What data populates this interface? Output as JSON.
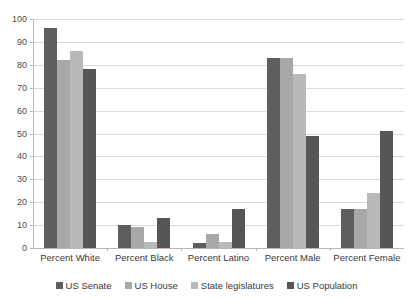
{
  "chart_data": {
    "type": "bar",
    "title": "",
    "subtitle": "",
    "xlabel": "",
    "ylabel": "",
    "ylim": [
      0,
      100
    ],
    "ytick_step": 10,
    "yticks": [
      0,
      10,
      20,
      30,
      40,
      50,
      60,
      70,
      80,
      90,
      100
    ],
    "grid": true,
    "legend_position": "bottom",
    "categories": [
      "Percent White",
      "Percent Black",
      "Percent Latino",
      "Percent Male",
      "Percent Female"
    ],
    "series": [
      {
        "name": "US Senate",
        "color": "#5e5e5e",
        "values": [
          96,
          10,
          2,
          83,
          17
        ]
      },
      {
        "name": "US House",
        "color": "#a8a8a8",
        "values": [
          82,
          9,
          6,
          83,
          17
        ]
      },
      {
        "name": "State legislatures",
        "color": "#b9b9b9",
        "values": [
          86,
          2.5,
          2.5,
          76,
          24
        ]
      },
      {
        "name": "US Population",
        "color": "#565656",
        "values": [
          78,
          13,
          17,
          49,
          51
        ]
      }
    ]
  }
}
